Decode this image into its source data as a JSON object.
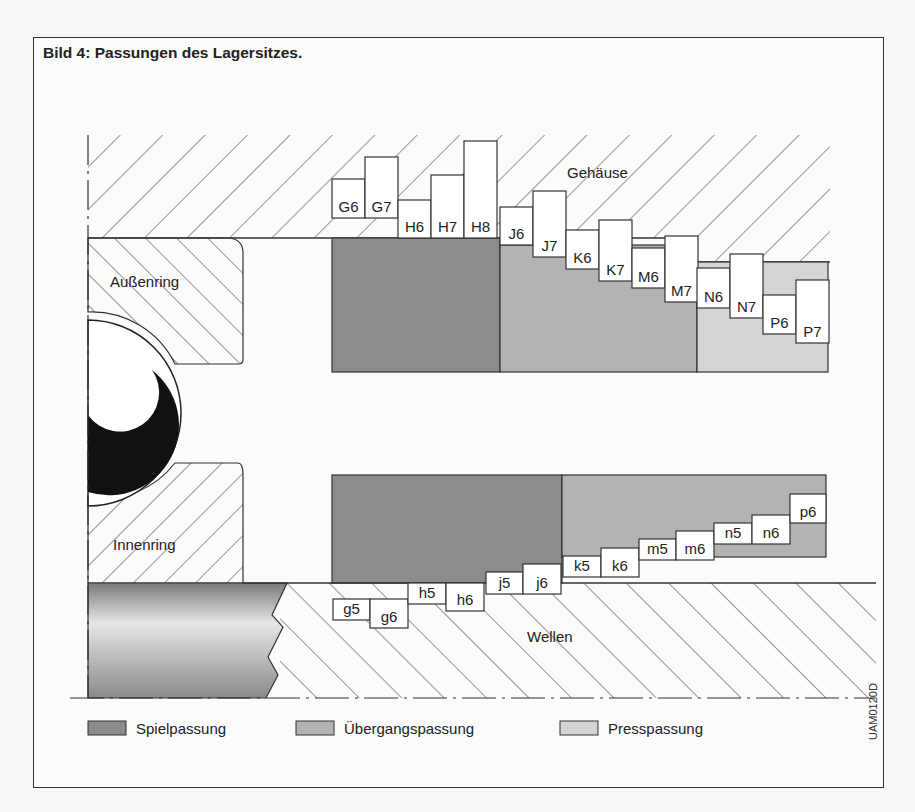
{
  "figure": {
    "title": "Bild 4: Passungen des Lagersitzes.",
    "code": "UAM0120D"
  },
  "labels": {
    "housing": "Gehäuse",
    "outer_ring": "Außenring",
    "inner_ring": "Innenring",
    "shaft": "Wellen"
  },
  "colors": {
    "spielpassung": "#8c8c8c",
    "uebergangspassung": "#b3b3b3",
    "presspassung": "#d4d4d4",
    "line": "#333333",
    "ball": "#111111"
  },
  "legend": [
    {
      "key": "spielpassung",
      "label": "Spielpassung",
      "color": "#8c8c8c"
    },
    {
      "key": "uebergangspassung",
      "label": "Übergangspassung",
      "color": "#b3b3b3"
    },
    {
      "key": "presspassung",
      "label": "Presspassung",
      "color": "#d4d4d4"
    }
  ],
  "housing_tolerances": [
    {
      "label": "G6",
      "x": 332,
      "w": 33,
      "top": 179,
      "bottom": 218,
      "fit": "spielpassung"
    },
    {
      "label": "G7",
      "x": 365,
      "w": 33,
      "top": 157,
      "bottom": 218,
      "fit": "spielpassung"
    },
    {
      "label": "H6",
      "x": 398,
      "w": 33,
      "top": 200,
      "bottom": 238,
      "fit": "spielpassung"
    },
    {
      "label": "H7",
      "x": 431,
      "w": 33,
      "top": 175,
      "bottom": 238,
      "fit": "spielpassung"
    },
    {
      "label": "H8",
      "x": 464,
      "w": 33,
      "top": 141,
      "bottom": 238,
      "fit": "spielpassung"
    },
    {
      "label": "J6",
      "x": 500,
      "w": 33,
      "top": 207,
      "bottom": 245,
      "fit": "uebergangspassung"
    },
    {
      "label": "J7",
      "x": 533,
      "w": 33,
      "top": 191,
      "bottom": 257,
      "fit": "uebergangspassung"
    },
    {
      "label": "K6",
      "x": 566,
      "w": 33,
      "top": 230,
      "bottom": 269,
      "fit": "uebergangspassung"
    },
    {
      "label": "K7",
      "x": 599,
      "w": 33,
      "top": 220,
      "bottom": 281,
      "fit": "uebergangspassung"
    },
    {
      "label": "M6",
      "x": 632,
      "w": 33,
      "top": 248,
      "bottom": 288,
      "fit": "uebergangspassung"
    },
    {
      "label": "M7",
      "x": 665,
      "w": 33,
      "top": 236,
      "bottom": 302,
      "fit": "uebergangspassung"
    },
    {
      "label": "N6",
      "x": 697,
      "w": 33,
      "top": 268,
      "bottom": 308,
      "fit": "presspassung"
    },
    {
      "label": "N7",
      "x": 730,
      "w": 33,
      "top": 254,
      "bottom": 318,
      "fit": "presspassung"
    },
    {
      "label": "P6",
      "x": 763,
      "w": 33,
      "top": 295,
      "bottom": 334,
      "fit": "presspassung"
    },
    {
      "label": "P7",
      "x": 796,
      "w": 33,
      "top": 280,
      "bottom": 343,
      "fit": "presspassung"
    }
  ],
  "shaft_tolerances": [
    {
      "label": "g5",
      "x": 333,
      "w": 37,
      "top": 599,
      "bottom": 620,
      "fit": "spielpassung"
    },
    {
      "label": "g6",
      "x": 370,
      "w": 38,
      "top": 599,
      "bottom": 628,
      "fit": "spielpassung"
    },
    {
      "label": "h5",
      "x": 408,
      "w": 38,
      "top": 583,
      "bottom": 604,
      "fit": "spielpassung"
    },
    {
      "label": "h6",
      "x": 446,
      "w": 38,
      "top": 583,
      "bottom": 611,
      "fit": "spielpassung"
    },
    {
      "label": "j5",
      "x": 486,
      "w": 37,
      "top": 572,
      "bottom": 594,
      "fit": "spielpassung"
    },
    {
      "label": "j6",
      "x": 523,
      "w": 38,
      "top": 564,
      "bottom": 594,
      "fit": "spielpassung"
    },
    {
      "label": "k5",
      "x": 563,
      "w": 38,
      "top": 556,
      "bottom": 577,
      "fit": "uebergangspassung"
    },
    {
      "label": "k6",
      "x": 601,
      "w": 38,
      "top": 548,
      "bottom": 577,
      "fit": "uebergangspassung"
    },
    {
      "label": "m5",
      "x": 639,
      "w": 37,
      "top": 539,
      "bottom": 560,
      "fit": "uebergangspassung"
    },
    {
      "label": "m6",
      "x": 676,
      "w": 38,
      "top": 531,
      "bottom": 560,
      "fit": "uebergangspassung"
    },
    {
      "label": "n5",
      "x": 714,
      "w": 38,
      "top": 523,
      "bottom": 544,
      "fit": "uebergangspassung"
    },
    {
      "label": "n6",
      "x": 752,
      "w": 38,
      "top": 515,
      "bottom": 544,
      "fit": "uebergangspassung"
    },
    {
      "label": "p6",
      "x": 790,
      "w": 36,
      "top": 494,
      "bottom": 523,
      "fit": "uebergangspassung"
    }
  ]
}
